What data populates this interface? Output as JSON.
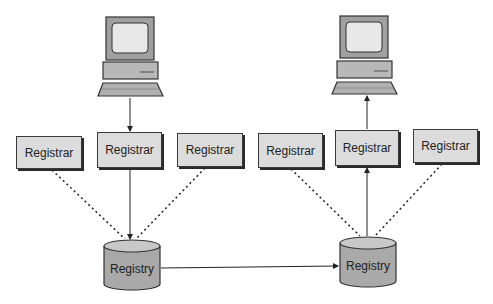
{
  "diagram": {
    "colors": {
      "box_fill": "#dcdcdc",
      "box_border": "#3a3a3a",
      "cylinder_fill": "#a9a9a9",
      "cylinder_top": "#c8c8c8",
      "monitor_frame": "#a0a0a0",
      "screen": "#e8e8e8",
      "line": "#222222"
    },
    "computers": [
      {
        "id": "computer-left",
        "role": "sender"
      },
      {
        "id": "computer-right",
        "role": "receiver"
      }
    ],
    "registrars": [
      {
        "label": "Registrar"
      },
      {
        "label": "Registrar"
      },
      {
        "label": "Registrar"
      },
      {
        "label": "Registrar"
      },
      {
        "label": "Registrar"
      },
      {
        "label": "Registrar"
      }
    ],
    "registries": [
      {
        "label": "Registry"
      },
      {
        "label": "Registry"
      }
    ],
    "edges": [
      {
        "from": "computer-left",
        "to": "registrar-2",
        "style": "solid",
        "arrow": "end"
      },
      {
        "from": "registrar-2",
        "to": "registry-1",
        "style": "solid",
        "arrow": "end"
      },
      {
        "from": "registrar-1",
        "to": "registry-1",
        "style": "dotted"
      },
      {
        "from": "registrar-3",
        "to": "registry-1",
        "style": "dotted"
      },
      {
        "from": "registry-1",
        "to": "registry-2",
        "style": "solid",
        "arrow": "end"
      },
      {
        "from": "registry-2",
        "to": "registrar-5",
        "style": "solid",
        "arrow": "end"
      },
      {
        "from": "registrar-5",
        "to": "computer-right",
        "style": "solid",
        "arrow": "end"
      },
      {
        "from": "registrar-4",
        "to": "registry-2",
        "style": "dotted"
      },
      {
        "from": "registrar-6",
        "to": "registry-2",
        "style": "dotted"
      }
    ]
  }
}
